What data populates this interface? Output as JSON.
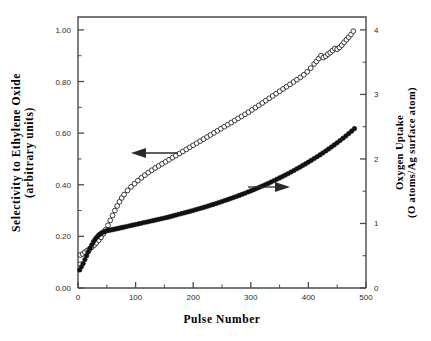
{
  "figure": {
    "background": "#ffffff",
    "frame_color": "#4a4a4a"
  },
  "axes": {
    "x_title": "Pulse  Number",
    "y_left_title_line1": "Selectivity  to  Ethylene  Oxide",
    "y_left_title_line2": "(arbitrary  units)",
    "y_right_title_line1": "Oxygen  Uptake",
    "y_right_title_line2": "(O atoms/Ag surface atom)",
    "x_ticklabels": [
      "0",
      "100",
      "200",
      "300",
      "400",
      "500"
    ],
    "y_left_ticklabels": [
      "0.00",
      "0.20",
      "0.40",
      "0.60",
      "0.80",
      "1.00"
    ],
    "y_right_ticklabels": [
      "0",
      "1",
      "2",
      "3",
      "4"
    ]
  },
  "annotations": {
    "left_arrow": "arrow-left",
    "right_arrow": "arrow-right"
  },
  "chart_data": {
    "type": "scatter",
    "title": "",
    "xlabel": "Pulse Number",
    "ylabel": "Selectivity to Ethylene Oxide (arbitrary units)",
    "y2label": "Oxygen Uptake (O atoms/Ag surface atom)",
    "xlim": [
      0,
      500
    ],
    "ylim": [
      0.0,
      1.05
    ],
    "y2lim": [
      0,
      4.2
    ],
    "xticks": [
      0,
      100,
      200,
      300,
      400,
      500
    ],
    "xticks_minor_step": 50,
    "yticks": [
      0.0,
      0.2,
      0.4,
      0.6,
      0.8,
      1.0
    ],
    "yticks_minor_step": 0.1,
    "y2ticks": [
      0,
      1,
      2,
      3,
      4
    ],
    "y2ticks_minor_step": 0.5,
    "grid": false,
    "legend": "none",
    "annotations": [
      {
        "text": "arrow pointing left",
        "points_to": "open-circle series",
        "axis": "left"
      },
      {
        "text": "arrow pointing right",
        "points_to": "filled-circle series",
        "axis": "right"
      }
    ],
    "series": [
      {
        "name": "Selectivity to Ethylene Oxide",
        "marker": "open-circle",
        "axis": "left",
        "color": "#1a1a1a",
        "x": [
          4,
          8,
          12,
          16,
          20,
          24,
          28,
          32,
          36,
          40,
          44,
          48,
          52,
          56,
          60,
          64,
          68,
          72,
          76,
          80,
          86,
          92,
          98,
          104,
          110,
          116,
          122,
          128,
          134,
          140,
          146,
          152,
          158,
          164,
          170,
          176,
          182,
          188,
          194,
          200,
          206,
          212,
          218,
          224,
          230,
          236,
          242,
          248,
          254,
          260,
          266,
          272,
          278,
          284,
          290,
          296,
          302,
          308,
          314,
          320,
          326,
          332,
          338,
          344,
          350,
          356,
          362,
          368,
          374,
          380,
          386,
          392,
          398,
          404,
          410,
          414,
          418,
          422,
          426,
          430,
          434,
          438,
          442,
          446,
          450,
          454,
          458,
          462,
          466,
          470,
          474,
          478
        ],
        "y": [
          0.128,
          0.132,
          0.139,
          0.145,
          0.15,
          0.158,
          0.166,
          0.175,
          0.185,
          0.196,
          0.21,
          0.226,
          0.243,
          0.262,
          0.281,
          0.3,
          0.318,
          0.334,
          0.349,
          0.362,
          0.378,
          0.392,
          0.404,
          0.416,
          0.427,
          0.437,
          0.447,
          0.456,
          0.465,
          0.473,
          0.481,
          0.489,
          0.497,
          0.505,
          0.513,
          0.521,
          0.529,
          0.537,
          0.545,
          0.553,
          0.561,
          0.569,
          0.577,
          0.585,
          0.593,
          0.601,
          0.609,
          0.617,
          0.625,
          0.633,
          0.641,
          0.649,
          0.657,
          0.665,
          0.673,
          0.681,
          0.69,
          0.699,
          0.708,
          0.717,
          0.726,
          0.735,
          0.744,
          0.753,
          0.762,
          0.771,
          0.78,
          0.789,
          0.798,
          0.807,
          0.816,
          0.826,
          0.838,
          0.852,
          0.868,
          0.878,
          0.889,
          0.9,
          0.893,
          0.898,
          0.906,
          0.912,
          0.92,
          0.928,
          0.925,
          0.932,
          0.941,
          0.952,
          0.962,
          0.972,
          0.982,
          0.995
        ]
      },
      {
        "name": "Oxygen Uptake",
        "marker": "filled-circle",
        "axis": "right",
        "color": "#111111",
        "x": [
          3,
          6,
          9,
          12,
          15,
          18,
          21,
          24,
          27,
          30,
          33,
          36,
          39,
          42,
          45,
          48,
          51,
          54,
          57,
          60,
          64,
          68,
          72,
          76,
          80,
          85,
          90,
          95,
          100,
          105,
          110,
          115,
          120,
          125,
          130,
          135,
          140,
          145,
          150,
          155,
          160,
          165,
          170,
          175,
          180,
          185,
          190,
          195,
          200,
          205,
          210,
          215,
          220,
          225,
          230,
          235,
          240,
          245,
          250,
          255,
          260,
          265,
          270,
          275,
          280,
          285,
          290,
          295,
          300,
          305,
          310,
          315,
          320,
          325,
          330,
          335,
          340,
          345,
          350,
          355,
          360,
          365,
          370,
          375,
          380,
          385,
          390,
          395,
          400,
          405,
          410,
          415,
          420,
          425,
          430,
          435,
          440,
          445,
          450,
          455,
          460,
          465,
          470,
          475,
          480
        ],
        "y2": [
          0.28,
          0.33,
          0.38,
          0.44,
          0.5,
          0.56,
          0.62,
          0.67,
          0.72,
          0.76,
          0.79,
          0.82,
          0.84,
          0.86,
          0.87,
          0.88,
          0.89,
          0.895,
          0.9,
          0.905,
          0.912,
          0.92,
          0.928,
          0.936,
          0.944,
          0.954,
          0.964,
          0.974,
          0.984,
          0.994,
          1.004,
          1.014,
          1.024,
          1.034,
          1.044,
          1.054,
          1.064,
          1.074,
          1.084,
          1.094,
          1.106,
          1.118,
          1.13,
          1.142,
          1.154,
          1.166,
          1.178,
          1.19,
          1.202,
          1.215,
          1.228,
          1.241,
          1.254,
          1.268,
          1.282,
          1.296,
          1.31,
          1.325,
          1.34,
          1.355,
          1.37,
          1.386,
          1.402,
          1.418,
          1.435,
          1.452,
          1.469,
          1.487,
          1.505,
          1.523,
          1.542,
          1.561,
          1.58,
          1.6,
          1.62,
          1.641,
          1.662,
          1.684,
          1.706,
          1.728,
          1.751,
          1.774,
          1.798,
          1.822,
          1.847,
          1.872,
          1.898,
          1.924,
          1.951,
          1.978,
          2.006,
          2.034,
          2.063,
          2.093,
          2.123,
          2.154,
          2.186,
          2.218,
          2.251,
          2.285,
          2.32,
          2.356,
          2.393,
          2.431,
          2.47,
          2.51
        ]
      }
    ]
  }
}
